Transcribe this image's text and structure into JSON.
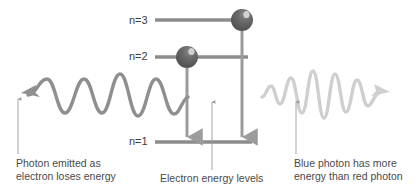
{
  "diagram": {
    "background_color": "#ffffff",
    "colors": {
      "dark_gray": "#8c8c8c",
      "electron_fill": "#5a5a5a",
      "electron_highlight": "#d8d8d8",
      "red_photon_wave": "#8f8f8f",
      "blue_photon_wave": "#cfcfcf",
      "leader_line": "#9a9a9a",
      "text": "#4a4a4a",
      "arrow": "#9b9b9b"
    },
    "energy_levels": [
      {
        "id": "n3",
        "label": "n=3",
        "y": 20,
        "x_start": 155,
        "x_end": 245
      },
      {
        "id": "n2",
        "label": "n=2",
        "y": 57,
        "x_start": 155,
        "x_end": 245
      },
      {
        "id": "n1",
        "label": "n=1",
        "y": 142,
        "x_start": 155,
        "x_end": 250
      }
    ],
    "electrons": [
      {
        "id": "electron-n3",
        "cx": 242,
        "cy": 20,
        "r": 11,
        "level": "n=3"
      },
      {
        "id": "electron-n2",
        "cx": 187,
        "cy": 57,
        "r": 11,
        "level": "n=2"
      }
    ],
    "transitions": [
      {
        "id": "transition-n2-to-n1",
        "x": 187,
        "y_start": 68,
        "y_end": 141,
        "direction": "down"
      },
      {
        "id": "transition-n3-to-n1",
        "x": 242,
        "y_start": 31,
        "y_end": 141,
        "direction": "down"
      }
    ],
    "photons": [
      {
        "id": "red-photon",
        "name": "red photon wave",
        "direction": "left",
        "cycles": 4,
        "amplitude": 24,
        "color": "#8f8f8f",
        "stroke_width": 3.4
      },
      {
        "id": "blue-photon",
        "name": "blue photon wave",
        "direction": "right",
        "cycles": 6,
        "amplitude": 22,
        "color": "#cfcfcf",
        "stroke_width": 3.4
      }
    ],
    "captions": {
      "left": {
        "line1": "Photon emitted as",
        "line2": "electron loses energy"
      },
      "middle": {
        "line1": "Electron energy levels"
      },
      "right": {
        "line1": "Blue photon has more",
        "line2": "energy than red photon"
      }
    },
    "leader_lines": [
      {
        "id": "leader-left",
        "x": 18,
        "y_top": 97,
        "y_bottom": 154
      },
      {
        "id": "leader-mid",
        "x": 212,
        "y_top": 100,
        "y_bottom": 170
      },
      {
        "id": "leader-right",
        "x": 296,
        "y_top": 100,
        "y_bottom": 154
      }
    ]
  }
}
